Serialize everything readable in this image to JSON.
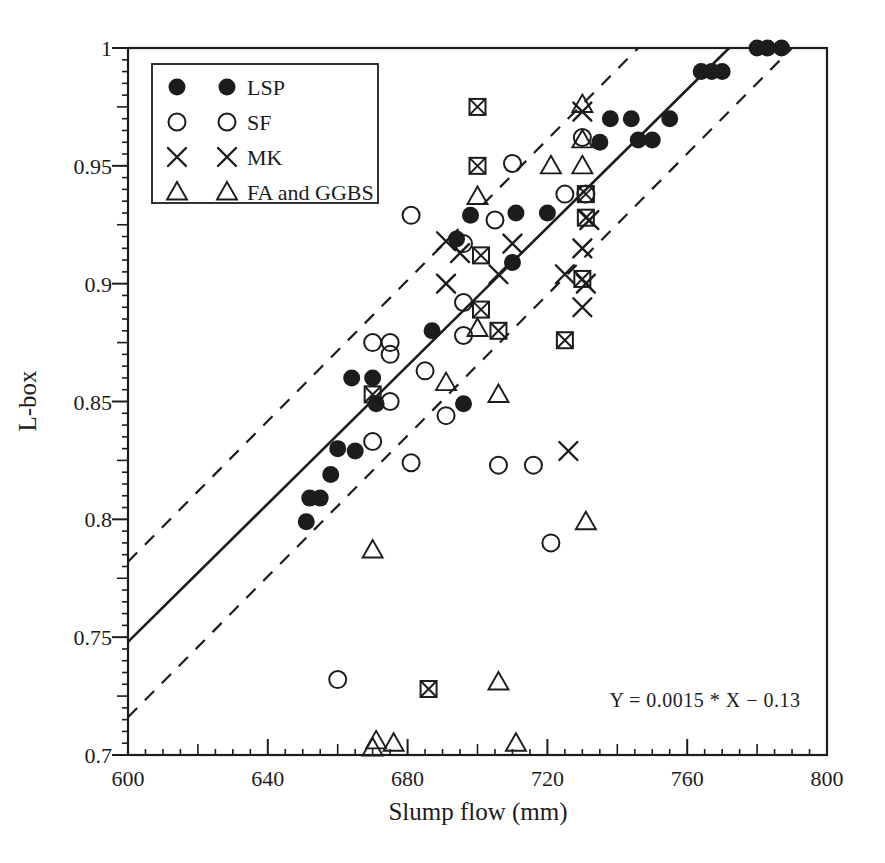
{
  "figure": {
    "background": "#ffffff",
    "ink_color": "#1c1c1c"
  },
  "chart_data": {
    "type": "scatter",
    "title": "",
    "xlabel": "Slump flow (mm)",
    "ylabel": "L-box",
    "xlim": [
      600,
      800
    ],
    "ylim": [
      0.7,
      1.0
    ],
    "grid": false,
    "x_ticks": {
      "values": [
        600,
        640,
        680,
        720,
        760,
        800
      ],
      "labels": [
        "600",
        "640",
        "680",
        "720",
        "760",
        "800"
      ],
      "minor_step": 5,
      "medium_step": 20,
      "major_step": 40
    },
    "y_ticks": {
      "values": [
        1.0,
        0.95,
        0.9,
        0.85,
        0.8,
        0.75,
        0.7
      ],
      "labels": [
        "1",
        "0.95",
        "0.9",
        "0.85",
        "0.8",
        "0.75",
        "0.7"
      ],
      "minor_step": 0.005,
      "medium_step": 0.025,
      "major_step": 0.05
    },
    "legend": {
      "position": "top-left",
      "items": [
        {
          "label": "LSP",
          "marker": "filled-circle"
        },
        {
          "label": "SF",
          "marker": "open-circle"
        },
        {
          "label": "MK",
          "marker": "x"
        },
        {
          "label": "FA and GGBS",
          "marker": "triangle"
        }
      ]
    },
    "annotation": {
      "text": "Y = 0.0015 * X − 0.13",
      "x": 765,
      "y": 0.7235
    },
    "lines": [
      {
        "name": "regression-line",
        "style": "solid",
        "points": [
          [
            600,
            0.748
          ],
          [
            772,
            1.0
          ]
        ]
      },
      {
        "name": "upper-band",
        "style": "dashed",
        "points": [
          [
            600,
            0.782
          ],
          [
            746,
            1.0
          ]
        ]
      },
      {
        "name": "lower-band",
        "style": "dashed",
        "points": [
          [
            600,
            0.716
          ],
          [
            790,
            1.0
          ]
        ]
      }
    ],
    "series": [
      {
        "name": "LSP",
        "marker": "filled-circle",
        "points": [
          [
            780,
            1.0
          ],
          [
            783,
            1.0
          ],
          [
            787,
            1.0
          ],
          [
            764,
            0.99
          ],
          [
            767,
            0.99
          ],
          [
            770,
            0.99
          ],
          [
            738,
            0.97
          ],
          [
            744,
            0.97
          ],
          [
            755,
            0.97
          ],
          [
            735,
            0.96
          ],
          [
            746,
            0.961
          ],
          [
            750,
            0.961
          ],
          [
            698,
            0.929
          ],
          [
            711,
            0.93
          ],
          [
            720,
            0.93
          ],
          [
            694,
            0.919
          ],
          [
            710,
            0.909
          ],
          [
            687,
            0.88
          ],
          [
            664,
            0.86
          ],
          [
            670,
            0.86
          ],
          [
            671,
            0.849
          ],
          [
            696,
            0.849
          ],
          [
            660,
            0.83
          ],
          [
            665,
            0.829
          ],
          [
            658,
            0.819
          ],
          [
            652,
            0.809
          ],
          [
            655,
            0.809
          ],
          [
            651,
            0.799
          ]
        ]
      },
      {
        "name": "SF",
        "marker": "open-circle",
        "points": [
          [
            730,
            0.962
          ],
          [
            710,
            0.951
          ],
          [
            725,
            0.938
          ],
          [
            731,
            0.938
          ],
          [
            681,
            0.929
          ],
          [
            705,
            0.927
          ],
          [
            696,
            0.917
          ],
          [
            696,
            0.892
          ],
          [
            696,
            0.878
          ],
          [
            670,
            0.875
          ],
          [
            675,
            0.875
          ],
          [
            675,
            0.87
          ],
          [
            685,
            0.863
          ],
          [
            675,
            0.85
          ],
          [
            691,
            0.844
          ],
          [
            670,
            0.833
          ],
          [
            681,
            0.824
          ],
          [
            706,
            0.823
          ],
          [
            716,
            0.823
          ],
          [
            721,
            0.79
          ],
          [
            660,
            0.732
          ]
        ]
      },
      {
        "name": "MK",
        "marker": "x",
        "points": [
          [
            730,
            0.973
          ],
          [
            732,
            0.927
          ],
          [
            691,
            0.918
          ],
          [
            710,
            0.917
          ],
          [
            730,
            0.915
          ],
          [
            695,
            0.913
          ],
          [
            706,
            0.904
          ],
          [
            725,
            0.904
          ],
          [
            691,
            0.9
          ],
          [
            731,
            0.9
          ],
          [
            730,
            0.89
          ],
          [
            726,
            0.829
          ]
        ]
      },
      {
        "name": "MK overlapped (boxed X)",
        "marker": "boxed-x",
        "points": [
          [
            700,
            0.975
          ],
          [
            700,
            0.95
          ],
          [
            731,
            0.938
          ],
          [
            731,
            0.928
          ],
          [
            701,
            0.912
          ],
          [
            730,
            0.902
          ],
          [
            701,
            0.889
          ],
          [
            706,
            0.88
          ],
          [
            725,
            0.876
          ],
          [
            670,
            0.853
          ],
          [
            686,
            0.728
          ]
        ]
      },
      {
        "name": "FA and GGBS",
        "marker": "triangle",
        "points": [
          [
            730,
            0.976
          ],
          [
            730,
            0.961
          ],
          [
            721,
            0.95
          ],
          [
            730,
            0.95
          ],
          [
            700,
            0.937
          ],
          [
            700,
            0.881
          ],
          [
            691,
            0.858
          ],
          [
            706,
            0.853
          ],
          [
            670,
            0.787
          ],
          [
            731,
            0.799
          ],
          [
            706,
            0.731
          ],
          [
            670,
            0.703
          ],
          [
            671,
            0.706
          ],
          [
            676,
            0.705
          ],
          [
            711,
            0.705
          ]
        ]
      }
    ]
  }
}
